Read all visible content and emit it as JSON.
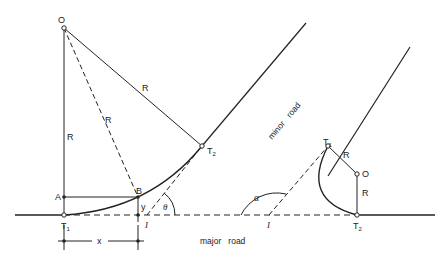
{
  "diagram": {
    "colors": {
      "line": "#222222",
      "background": "#ffffff"
    },
    "left_figure": {
      "center_label": "O",
      "radius_labels": [
        "R",
        "R",
        "R"
      ],
      "point_A": "A",
      "point_B": "B",
      "tangent_1": "T",
      "tangent_1_sub": "1",
      "tangent_2": "T",
      "tangent_2_sub": "2",
      "intersection": "I",
      "offset_y": "y",
      "offset_x": "x",
      "angle": "θ"
    },
    "right_figure": {
      "center_label": "O",
      "radius_labels": [
        "R",
        "R"
      ],
      "tangent_1": "T",
      "tangent_1_sub": "1",
      "tangent_2": "T",
      "tangent_2_sub": "2",
      "intersection": "I",
      "angle": "α"
    },
    "road_labels": {
      "major": "major   road",
      "minor": "minor   road"
    }
  }
}
